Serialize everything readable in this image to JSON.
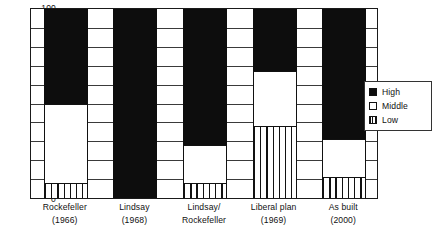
{
  "chart_data": {
    "type": "bar",
    "subtype": "stacked-bar-100",
    "title": "",
    "xlabel": "",
    "ylabel": "",
    "ylim": [
      0,
      100
    ],
    "yticks": [
      0,
      10,
      20,
      30,
      40,
      50,
      60,
      70,
      80,
      90,
      100
    ],
    "ytick_labels": [
      "0",
      "10",
      "20",
      "30",
      "40",
      "50",
      "60",
      "70",
      "80",
      "90",
      "100"
    ],
    "grid": true,
    "legend_position": "right",
    "categories": [
      "Rockefeller (1966)",
      "Lindsay (1968)",
      "Lindsay/ Rockefeller",
      "Liberal plan (1969)",
      "As built (2000)"
    ],
    "category_lines": [
      [
        "Rockefeller",
        "(1966)"
      ],
      [
        "Lindsay",
        "(1968)"
      ],
      [
        "Lindsay/",
        "Rockefeller"
      ],
      [
        "Liberal plan",
        "(1969)"
      ],
      [
        "As built",
        "(2000)"
      ]
    ],
    "series": [
      {
        "name": "High",
        "color": "#0d0d0d",
        "fill": "solid-black",
        "values": [
          50,
          100,
          72,
          33,
          69
        ]
      },
      {
        "name": "Middle",
        "color": "#ffffff",
        "fill": "white",
        "values": [
          42,
          0,
          20,
          29,
          20
        ]
      },
      {
        "name": "Low",
        "color": "#ffffff",
        "fill": "vertical-hatch",
        "values": [
          8,
          0,
          8,
          38,
          11
        ]
      }
    ],
    "stack_boundaries": {
      "note": "cumulative top value of each segment, 0-100 scale",
      "Rockefeller (1966)": {
        "low_top": 8,
        "middle_top": 50,
        "high_top": 100
      },
      "Lindsay (1968)": {
        "low_top": 0,
        "middle_top": 0,
        "high_top": 100
      },
      "Lindsay/ Rockefeller": {
        "low_top": 8,
        "middle_top": 28,
        "high_top": 100
      },
      "Liberal plan (1969)": {
        "low_top": 38,
        "middle_top": 67,
        "high_top": 100
      },
      "As built (2000)": {
        "low_top": 11,
        "middle_top": 31,
        "high_top": 100
      }
    }
  },
  "legend": {
    "items": [
      {
        "label": "High",
        "swatch": "solid-black-swatch"
      },
      {
        "label": "Middle",
        "swatch": "white-swatch"
      },
      {
        "label": "Low",
        "swatch": "hatched-swatch"
      }
    ]
  }
}
